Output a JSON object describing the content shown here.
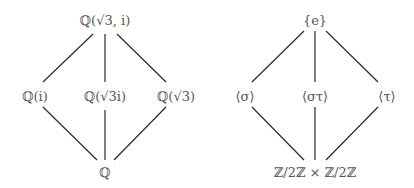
{
  "diagrams": {
    "field_lattice": {
      "top": "ℚ(√3, i)",
      "middle": [
        "ℚ(i)",
        "ℚ(√3i)",
        "ℚ(√3)"
      ],
      "bottom": "ℚ"
    },
    "group_lattice": {
      "top": "{e}",
      "middle": [
        "⟨σ⟩",
        "⟨στ⟩",
        "⟨τ⟩"
      ],
      "bottom": "ℤ/2ℤ × ℤ/2ℤ"
    }
  },
  "style": {
    "line_color": "#2a2a2a",
    "text_color": "#555555",
    "background": "#ffffff"
  }
}
